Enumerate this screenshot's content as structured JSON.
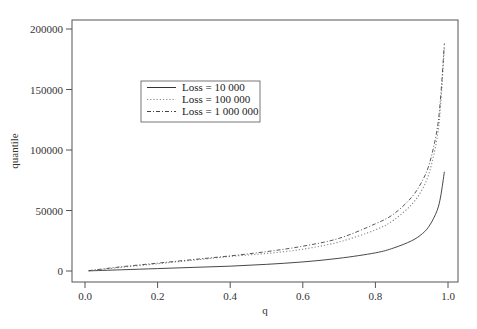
{
  "chart_data": {
    "type": "line",
    "title": "",
    "xlabel": "q",
    "ylabel": "quantile",
    "xlim": [
      0.0,
      1.0
    ],
    "ylim": [
      0,
      200000
    ],
    "xticks": [
      0.0,
      0.2,
      0.4,
      0.6,
      0.8,
      1.0
    ],
    "xtick_labels": [
      "0.0",
      "0.2",
      "0.4",
      "0.6",
      "0.8",
      "1.0"
    ],
    "yticks": [
      0,
      50000,
      100000,
      150000,
      200000
    ],
    "ytick_labels": [
      "0",
      "50000",
      "100000",
      "150000",
      "200000"
    ],
    "grid": false,
    "legend_position": "upper-left-center",
    "x": [
      0.01,
      0.1,
      0.2,
      0.3,
      0.4,
      0.5,
      0.6,
      0.7,
      0.8,
      0.85,
      0.9,
      0.93,
      0.95,
      0.97,
      0.98,
      0.99
    ],
    "series": [
      {
        "name": "Loss = 10 000",
        "style": "solid",
        "values": [
          100,
          1000,
          2000,
          3000,
          4000,
          5500,
          7500,
          10500,
          15000,
          19000,
          25000,
          31000,
          38000,
          50000,
          62000,
          82000
        ]
      },
      {
        "name": "Loss = 100 000",
        "style": "dotted",
        "values": [
          200,
          3000,
          6000,
          9000,
          12000,
          14500,
          18000,
          24000,
          34000,
          42000,
          55000,
          68000,
          83000,
          110000,
          138000,
          185000
        ]
      },
      {
        "name": "Loss = 1 000 000",
        "style": "dashdot",
        "values": [
          300,
          3500,
          6500,
          9500,
          12500,
          16000,
          20500,
          27000,
          39000,
          47000,
          61000,
          75000,
          90000,
          117000,
          145000,
          188000
        ]
      }
    ]
  }
}
